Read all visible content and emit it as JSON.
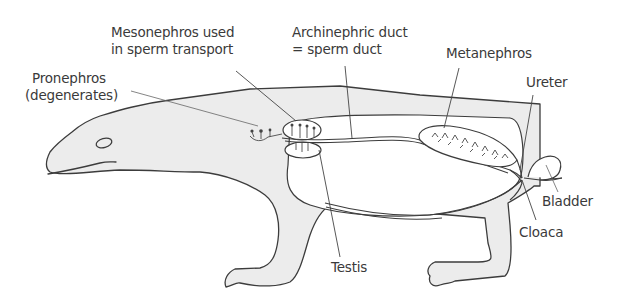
{
  "figure": {
    "labels": {
      "mesonephros": [
        "Mesonephros used",
        "in sperm transport"
      ],
      "archinephric": [
        "Archinephric duct",
        "= sperm duct"
      ],
      "pronephros": [
        "Pronephros",
        "(degenerates)"
      ],
      "metanephros": "Metanephros",
      "ureter": "Ureter",
      "bladder": "Bladder",
      "cloaca": "Cloaca",
      "testis": "Testis"
    },
    "colors": {
      "body_fill": "#ececec",
      "outline": "#3c3c3c",
      "text": "#3a3a3a",
      "background": "#ffffff"
    }
  }
}
